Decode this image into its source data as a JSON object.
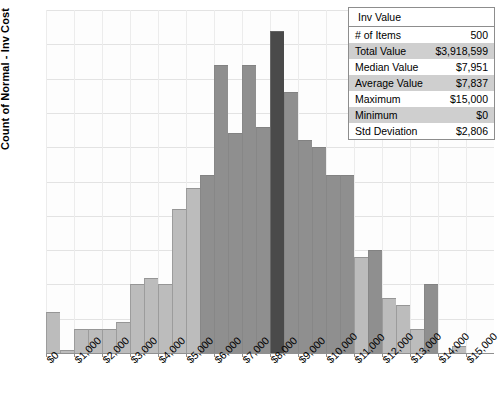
{
  "chart_data": {
    "type": "bar",
    "title": "",
    "xlabel": "",
    "ylabel": "Count of Normal - Inv Cost",
    "ylim": [
      0,
      50
    ],
    "ytick_step": 5,
    "yticks": [
      0,
      5,
      10,
      15,
      20,
      25,
      30,
      35,
      40,
      45,
      50
    ],
    "xticks": [
      "$0",
      "$1,000",
      "$2,000",
      "$3,000",
      "$4,000",
      "$5,000",
      "$6,000",
      "$7,000",
      "$8,000",
      "$9,000",
      "$10,000",
      "$11,000",
      "$12,000",
      "$13,000",
      "$14,000",
      "$15,000"
    ],
    "xlim": [
      0,
      16000
    ],
    "bin_width": 500,
    "grid": true,
    "legend": "none",
    "bin_starts": [
      0,
      500,
      1000,
      1500,
      2000,
      2500,
      3000,
      3500,
      4000,
      4500,
      5000,
      5500,
      6000,
      6500,
      7000,
      7500,
      8000,
      8500,
      9000,
      9500,
      10000,
      10500,
      11000,
      11500,
      12000,
      12500,
      13000,
      13500,
      14000,
      14500,
      15000,
      15500
    ],
    "values": [
      6,
      0.5,
      3.5,
      3.5,
      3.5,
      4.5,
      10,
      11,
      10,
      21,
      24,
      26,
      42,
      32,
      42,
      33,
      47,
      38,
      31,
      30,
      26,
      26,
      14,
      15,
      8,
      7,
      3.5,
      10,
      0,
      1,
      0,
      0
    ],
    "bar_colors": [
      "light",
      "light",
      "light",
      "light",
      "light",
      "light",
      "light",
      "light",
      "light",
      "light",
      "light",
      "mid",
      "mid",
      "mid",
      "mid",
      "mid",
      "dark",
      "mid",
      "mid",
      "mid",
      "mid",
      "mid",
      "light",
      "mid",
      "light",
      "light",
      "light",
      "mid",
      "none",
      "light",
      "none",
      "none"
    ],
    "colors": {
      "light": "#bcbcbc",
      "mid": "#8f8f8f",
      "dark": "#4a4a4a",
      "gridline": "#e3e3e3",
      "axis": "#8f8f8f",
      "background": "#ffffff"
    }
  },
  "stats_table": {
    "title": "Inv Value",
    "rows": [
      {
        "label": "# of Items",
        "value": "500",
        "shaded": false
      },
      {
        "label": "Total Value",
        "value": "$3,918,599",
        "shaded": true
      },
      {
        "label": "Median Value",
        "value": "$7,951",
        "shaded": false
      },
      {
        "label": "Average Value",
        "value": "$7,837",
        "shaded": true
      },
      {
        "label": "Maximum",
        "value": "$15,000",
        "shaded": false
      },
      {
        "label": "Minimum",
        "value": "$0",
        "shaded": true
      },
      {
        "label": "Std Deviation",
        "value": "$2,806",
        "shaded": false
      }
    ]
  }
}
